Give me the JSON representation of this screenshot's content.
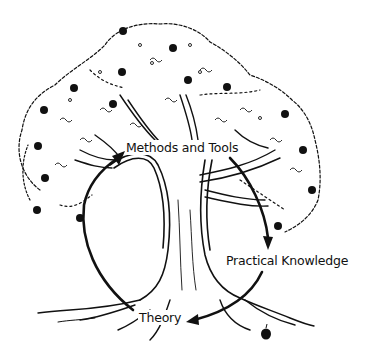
{
  "diagram": {
    "type": "cycle-illustration",
    "illustration": "apple-tree",
    "colors": {
      "ink": "#111111",
      "background": "#ffffff"
    },
    "labels": {
      "methods": "Methods and Tools",
      "practical": "Practical Knowledge",
      "theory": "Theory"
    },
    "cycle": [
      {
        "from": "Methods and Tools",
        "to": "Practical Knowledge"
      },
      {
        "from": "Practical Knowledge",
        "to": "Theory"
      },
      {
        "from": "Theory",
        "to": "Methods and Tools"
      }
    ],
    "apples_in_canopy": 17,
    "apples_on_ground": 1
  }
}
